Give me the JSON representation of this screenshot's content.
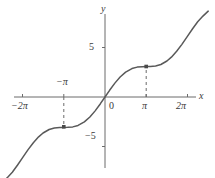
{
  "figure": {
    "title": "",
    "axis_labels": {
      "x": "x",
      "y": "y"
    },
    "tick_labels": {
      "y_pos_5": "5",
      "y_neg_5": "−5",
      "x_neg_2pi": "−2π",
      "x_neg_pi": "−π",
      "x_zero": "0",
      "x_pi": "π",
      "x_2pi": "2π"
    },
    "colors": {
      "curve": "#595959",
      "axis": "#6b6b6b",
      "text": "#3a3a3a",
      "marker": "#4a4a4a",
      "dashed": "#6b6b6b",
      "background": "#ffffff"
    }
  },
  "chart_data": {
    "type": "line",
    "title": "",
    "xlabel": "x",
    "ylabel": "y",
    "function": "y = x + sin(x)",
    "xlim": [
      -7.85,
      7.85
    ],
    "ylim": [
      -8.3,
      8.7
    ],
    "grid": false,
    "legend": null,
    "x_ticks": [
      -6.283185,
      -3.141593,
      0,
      3.141593,
      6.283185
    ],
    "x_tick_labels": [
      "−2π",
      "−π",
      "0",
      "π",
      "2π"
    ],
    "y_ticks": [
      -5,
      5
    ],
    "y_tick_labels": [
      "−5",
      "5"
    ],
    "series": [
      {
        "name": "y = x + sin(x)",
        "x": [
          -7.85,
          -7.45,
          -7.05,
          -6.65,
          -6.28,
          -5.85,
          -5.45,
          -5.05,
          -4.71,
          -4.25,
          -3.85,
          -3.45,
          -3.14,
          -2.85,
          -2.45,
          -2.05,
          -1.57,
          -1.15,
          -0.75,
          -0.35,
          0,
          0.35,
          0.75,
          1.15,
          1.57,
          2.05,
          2.45,
          2.85,
          3.14,
          3.45,
          3.85,
          4.25,
          4.71,
          5.05,
          5.45,
          5.85,
          6.28,
          6.65,
          7.05,
          7.45,
          7.85
        ],
        "y": [
          -8.85,
          -8.34,
          -7.76,
          -7.01,
          -6.28,
          -5.43,
          -4.71,
          -4.11,
          -3.71,
          -3.35,
          -3.2,
          -3.15,
          -3.14,
          -3.13,
          -3.08,
          -2.93,
          -2.57,
          -2.06,
          -1.43,
          -0.69,
          0,
          0.69,
          1.43,
          2.06,
          2.57,
          2.93,
          3.08,
          3.13,
          3.14,
          3.15,
          3.2,
          3.35,
          3.71,
          4.11,
          4.71,
          5.43,
          6.28,
          7.01,
          7.76,
          8.34,
          8.85
        ]
      }
    ],
    "markers": [
      {
        "label": "inflection-left",
        "x": -3.141593,
        "y": -3.141593,
        "x_label": "−π",
        "dashed_guide": true
      },
      {
        "label": "inflection-right",
        "x": 3.141593,
        "y": 3.141593,
        "x_label": "π",
        "dashed_guide": true
      }
    ]
  }
}
